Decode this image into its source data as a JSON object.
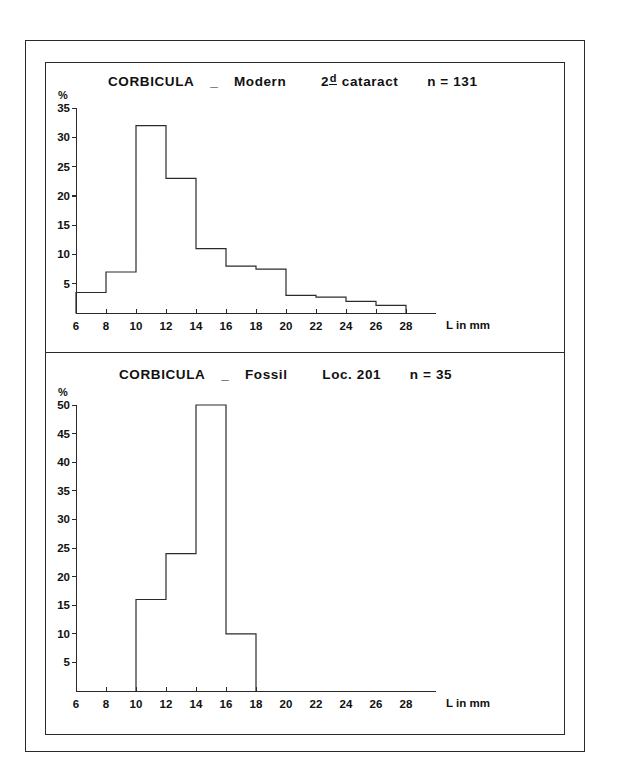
{
  "figure": {
    "background_color": "#ffffff",
    "line_color": "#2b2b2b"
  },
  "panels": {
    "modern": {
      "title_taxon": "CORBICULA",
      "title_dash": "_",
      "title_kind": "Modern",
      "title_locality_prefix": "2",
      "title_locality_sup": "d",
      "title_locality": "cataract",
      "title_count": "n = 131"
    },
    "fossil": {
      "title_taxon": "CORBICULA",
      "title_dash": "_",
      "title_kind": "Fossil",
      "title_locality": "Loc. 201",
      "title_count": "n = 35"
    }
  },
  "chart_data": [
    {
      "type": "bar",
      "id": "corbicula-modern",
      "title": "CORBICULA _ Modern    2d cataract   n = 131",
      "subtitle": "2d cataract",
      "sample_size": 131,
      "xlabel": "L in mm",
      "ylabel": "%",
      "xlim": [
        6,
        30
      ],
      "ylim": [
        0,
        35
      ],
      "xticks": [
        6,
        8,
        10,
        12,
        14,
        16,
        18,
        20,
        22,
        24,
        26,
        28
      ],
      "yticks": [
        5,
        10,
        15,
        20,
        25,
        30,
        35
      ],
      "grid": false,
      "legend": "none",
      "bin_width": 2,
      "bin_edges": [
        6,
        8,
        10,
        12,
        14,
        16,
        18,
        20,
        22,
        24,
        26,
        28
      ],
      "categories": [
        "6-8",
        "8-10",
        "10-12",
        "12-14",
        "14-16",
        "16-18",
        "18-20",
        "20-22",
        "22-24",
        "24-26",
        "26-28"
      ],
      "values": [
        3.5,
        7,
        32,
        23,
        11,
        8,
        7.5,
        3,
        2.7,
        2,
        1.3
      ]
    },
    {
      "type": "bar",
      "id": "corbicula-fossil",
      "title": "CORBICULA _ Fossil    Loc. 201   n = 35",
      "subtitle": "Loc. 201",
      "sample_size": 35,
      "xlabel": "L in mm",
      "ylabel": "%",
      "xlim": [
        6,
        30
      ],
      "ylim": [
        0,
        50
      ],
      "xticks": [
        6,
        8,
        10,
        12,
        14,
        16,
        18,
        20,
        22,
        24,
        26,
        28
      ],
      "yticks": [
        5,
        10,
        15,
        20,
        25,
        30,
        35,
        40,
        45,
        50
      ],
      "grid": false,
      "legend": "none",
      "bin_width": 2,
      "bin_edges": [
        10,
        12,
        14,
        16,
        18
      ],
      "categories": [
        "10-12",
        "12-14",
        "14-16",
        "16-18"
      ],
      "values": [
        16,
        24,
        50,
        10
      ]
    }
  ]
}
